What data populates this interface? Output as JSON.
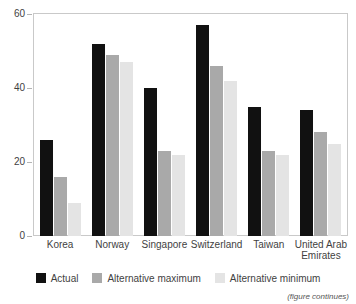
{
  "figure": {
    "title": "",
    "note": "(figure continues)"
  },
  "colors": {
    "actual": "#111111",
    "alternative_maximum": "#a9a9a9",
    "alternative_minimum": "#e4e4e4",
    "frame": "#c9c9c9",
    "text": "#3f3f3f"
  },
  "legend": {
    "position": "bottom",
    "items": [
      {
        "label": "Actual",
        "color": "#111111"
      },
      {
        "label": "Alternative maximum",
        "color": "#a9a9a9"
      },
      {
        "label": "Alternative minimum",
        "color": "#e4e4e4"
      }
    ]
  },
  "axes": {
    "y_ticks": [
      "0",
      "20",
      "40",
      "60"
    ],
    "y_min": 0,
    "y_max": 60
  },
  "chart_data": {
    "type": "bar",
    "title": "",
    "xlabel": "",
    "ylabel": "",
    "ylim": [
      0,
      60
    ],
    "yticks": [
      0,
      20,
      40,
      60
    ],
    "grid": false,
    "legend_position": "bottom",
    "categories": [
      "Korea",
      "Norway",
      "Singapore",
      "Switzerland",
      "Taiwan",
      "United Arab Emirates"
    ],
    "series": [
      {
        "name": "Actual",
        "color": "#111111",
        "values": [
          26,
          52,
          40,
          57,
          35,
          34
        ]
      },
      {
        "name": "Alternative maximum",
        "color": "#a9a9a9",
        "values": [
          16,
          49,
          23,
          46,
          23,
          28
        ]
      },
      {
        "name": "Alternative minimum",
        "color": "#e4e4e4",
        "values": [
          9,
          47,
          22,
          42,
          22,
          25
        ]
      }
    ],
    "annotations": [
      "(figure continues)"
    ]
  }
}
